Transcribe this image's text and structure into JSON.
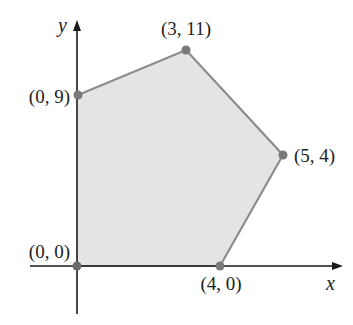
{
  "diagram": {
    "type": "feasible-region-polygon",
    "axes": {
      "x_label": "x",
      "y_label": "y"
    },
    "colors": {
      "fill": "#e4e4e4",
      "edge": "#8c8c8c",
      "vertex": "#7a7a7a",
      "axis": "#1a1a1a"
    },
    "vertices": [
      {
        "label": "(0, 0)",
        "x": 0,
        "y": 0
      },
      {
        "label": "(0, 9)",
        "x": 0,
        "y": 9
      },
      {
        "label": "(3, 11)",
        "x": 3,
        "y": 11
      },
      {
        "label": "(5, 4)",
        "x": 5,
        "y": 4
      },
      {
        "label": "(4, 0)",
        "x": 4,
        "y": 0
      }
    ]
  }
}
